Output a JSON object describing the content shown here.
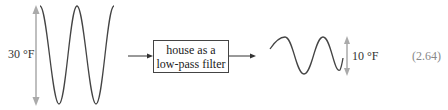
{
  "diagram": {
    "input_amplitude_label": "30 °F",
    "filter_box": {
      "line1": "house as a",
      "line2": "low-pass filter"
    },
    "output_amplitude_label": "10 °F",
    "equation_number": "(2.64)",
    "colors": {
      "wave": "#444444",
      "amplitude_arrow": "#aaaaaa",
      "flow_arrow": "#333333",
      "equation_number": "#888888"
    }
  }
}
